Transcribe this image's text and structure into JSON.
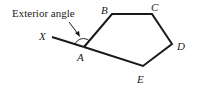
{
  "diagram": {
    "title_label": "Exterior angle",
    "vertices": [
      {
        "name": "A",
        "x": 84,
        "y": 47
      },
      {
        "name": "B",
        "x": 112,
        "y": 14
      },
      {
        "name": "C",
        "x": 152,
        "y": 14
      },
      {
        "name": "D",
        "x": 172,
        "y": 44
      },
      {
        "name": "E",
        "x": 143,
        "y": 66
      }
    ],
    "extension_point": {
      "name": "X",
      "x": 52,
      "y": 37
    },
    "labels": {
      "X": "X",
      "A": "A",
      "B": "B",
      "C": "C",
      "D": "D",
      "E": "E"
    },
    "stroke_color": "#1a1a1a"
  }
}
